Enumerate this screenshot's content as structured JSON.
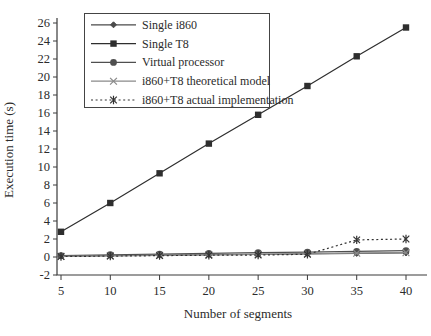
{
  "chart_data": {
    "type": "line",
    "title": "",
    "xlabel": "Number of segments",
    "ylabel": "Execution time (s)",
    "x": [
      5,
      10,
      15,
      20,
      25,
      30,
      35,
      40
    ],
    "xticks": [
      5,
      10,
      15,
      20,
      25,
      30,
      35,
      40
    ],
    "yticks": [
      -2,
      0,
      2,
      4,
      6,
      8,
      10,
      12,
      14,
      16,
      18,
      20,
      22,
      24,
      26
    ],
    "xlim": [
      5,
      40
    ],
    "ylim": [
      -2,
      26
    ],
    "grid": false,
    "legend_position": "top-left-inside",
    "axis_color": "#3a3a3a",
    "background_color": "#ffffff",
    "series": [
      {
        "name": "Single i860",
        "marker": "diamond",
        "line": "solid",
        "color": "#4a4a4a",
        "values": [
          0.1,
          0.15,
          0.2,
          0.25,
          0.3,
          0.35,
          0.4,
          0.45
        ]
      },
      {
        "name": "Single T8",
        "marker": "square",
        "line": "solid",
        "color": "#2e2e2e",
        "values": [
          2.8,
          6.0,
          9.3,
          12.6,
          15.8,
          19.0,
          22.3,
          25.5
        ]
      },
      {
        "name": "Virtual processor",
        "marker": "circle",
        "line": "solid",
        "color": "#4f4f4f",
        "values": [
          0.15,
          0.25,
          0.32,
          0.4,
          0.48,
          0.55,
          0.62,
          0.7
        ]
      },
      {
        "name": "i860+T8 theoretical model",
        "marker": "x-cross",
        "line": "solid",
        "color": "#8a8a8a",
        "values": [
          0.08,
          0.13,
          0.18,
          0.24,
          0.3,
          0.36,
          0.42,
          0.48
        ]
      },
      {
        "name": "i860+T8 actual implementation",
        "marker": "asterisk",
        "line": "dotted",
        "color": "#333333",
        "values": [
          0.05,
          0.1,
          0.15,
          0.2,
          0.22,
          0.3,
          1.9,
          2.0
        ]
      }
    ]
  }
}
